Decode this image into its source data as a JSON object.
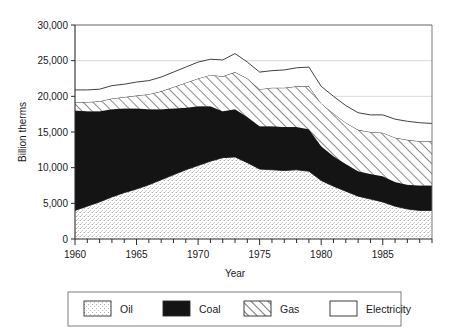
{
  "chart_data": {
    "type": "area",
    "stacked": true,
    "title": "",
    "xlabel": "Year",
    "ylabel": "Billion therms",
    "xlim": [
      1960,
      1989
    ],
    "ylim": [
      0,
      30000
    ],
    "ytick_labels": [
      "0",
      "5,000",
      "10,000",
      "15,000",
      "20,000",
      "25,000",
      "30,000"
    ],
    "ytick_values": [
      0,
      5000,
      10000,
      15000,
      20000,
      25000,
      30000
    ],
    "xtick_labels": [
      "1960",
      "1965",
      "1970",
      "1975",
      "1980",
      "1985"
    ],
    "xtick_values": [
      1960,
      1965,
      1970,
      1975,
      1980,
      1985
    ],
    "x_minor_tick_interval": 1,
    "grid": "horizontal",
    "legend_position": "bottom",
    "x": [
      1960,
      1961,
      1962,
      1963,
      1964,
      1965,
      1966,
      1967,
      1968,
      1969,
      1970,
      1971,
      1972,
      1973,
      1974,
      1975,
      1976,
      1977,
      1978,
      1979,
      1980,
      1981,
      1982,
      1983,
      1984,
      1985,
      1986,
      1987,
      1988,
      1989
    ],
    "series": [
      {
        "name": "Oil",
        "fill": "stipple",
        "values": [
          4000,
          4600,
          5200,
          5900,
          6500,
          7000,
          7600,
          8300,
          9000,
          9700,
          10300,
          10900,
          11400,
          11500,
          10700,
          9800,
          9700,
          9600,
          9700,
          9500,
          8200,
          7400,
          6700,
          6000,
          5600,
          5200,
          4600,
          4200,
          4000,
          4000
        ]
      },
      {
        "name": "Coal",
        "fill": "solid-black",
        "values": [
          14000,
          13300,
          12700,
          12300,
          11800,
          11300,
          10600,
          9900,
          9300,
          8700,
          8300,
          7700,
          6500,
          6700,
          6400,
          6000,
          6100,
          6100,
          6000,
          5900,
          4800,
          4200,
          3800,
          3500,
          3500,
          3600,
          3400,
          3400,
          3500,
          3500
        ]
      },
      {
        "name": "Gas",
        "fill": "hatch",
        "values": [
          1200,
          1300,
          1400,
          1500,
          1600,
          1800,
          2100,
          2500,
          3000,
          3500,
          3900,
          4400,
          4900,
          5200,
          5400,
          5200,
          5400,
          5500,
          5700,
          6000,
          6000,
          6000,
          5800,
          5800,
          5900,
          6100,
          6200,
          6300,
          6200,
          6200
        ]
      },
      {
        "name": "Electricity",
        "fill": "white",
        "values": [
          1700,
          1700,
          1700,
          1800,
          1800,
          1900,
          1900,
          2000,
          2100,
          2200,
          2300,
          2200,
          2300,
          2600,
          2300,
          2400,
          2400,
          2500,
          2600,
          2700,
          2400,
          2400,
          2400,
          2400,
          2400,
          2500,
          2600,
          2600,
          2600,
          2500
        ]
      }
    ],
    "totals": [
      20900,
      20900,
      21000,
      21500,
      21700,
      22000,
      22200,
      22700,
      23400,
      24100,
      24800,
      25200,
      25100,
      26000,
      24800,
      23400,
      23600,
      23700,
      24000,
      24100,
      21400,
      20000,
      18700,
      17700,
      17400,
      17400,
      16800,
      16500,
      16300,
      16200
    ]
  },
  "legend": {
    "items": [
      {
        "label": "Oil",
        "pattern": "stipple"
      },
      {
        "label": "Coal",
        "pattern": "solid-black"
      },
      {
        "label": "Gas",
        "pattern": "hatch"
      },
      {
        "label": "Electricity",
        "pattern": "white"
      }
    ]
  }
}
